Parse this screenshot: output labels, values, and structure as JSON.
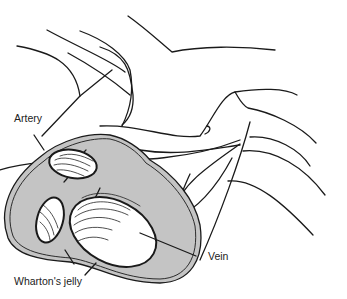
{
  "diagram": {
    "fill_color": "#c4c4c4",
    "line_color": "#1a1a1a",
    "labels": {
      "artery": "Artery",
      "vein": "Vein",
      "wharton": "Wharton's jelly"
    }
  }
}
